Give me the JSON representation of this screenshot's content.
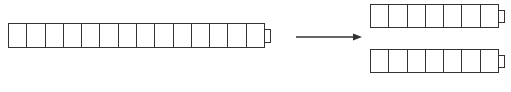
{
  "diagram": {
    "source_bar": {
      "cells": 14,
      "x": 8,
      "y": 23,
      "width": 257,
      "height": 25,
      "tab": true
    },
    "arrow": {
      "x1": 296,
      "y1": 37,
      "x2": 362,
      "y2": 37,
      "color": "#333333"
    },
    "result_bars": [
      {
        "cells": 7,
        "x": 370,
        "y": 4,
        "width": 129,
        "height": 24,
        "tab": true
      },
      {
        "cells": 7,
        "x": 370,
        "y": 49,
        "width": 129,
        "height": 24,
        "tab": true
      }
    ],
    "stroke_color": "#333333"
  }
}
